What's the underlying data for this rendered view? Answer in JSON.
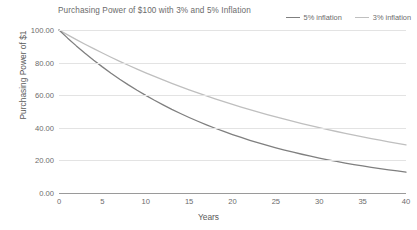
{
  "chart_data": {
    "type": "line",
    "title": "Purchasing Power of $100 with 3% and 5% Inflation",
    "xlabel": "Years",
    "ylabel": "Purchasing Power of $1",
    "xlim": [
      0,
      40
    ],
    "ylim": [
      0,
      100
    ],
    "grid": true,
    "legend_position": "top-right",
    "xticks": [
      "0",
      "5",
      "10",
      "15",
      "20",
      "25",
      "30",
      "35",
      "40"
    ],
    "xtick_values": [
      0,
      5,
      10,
      15,
      20,
      25,
      30,
      35,
      40
    ],
    "yticks": [
      "0.00",
      "20.00",
      "40.00",
      "60.00",
      "80.00",
      "100.00"
    ],
    "ytick_values": [
      0,
      20,
      40,
      60,
      80,
      100
    ],
    "x": [
      0,
      1,
      2,
      3,
      4,
      5,
      6,
      7,
      8,
      9,
      10,
      11,
      12,
      13,
      14,
      15,
      16,
      17,
      18,
      19,
      20,
      21,
      22,
      23,
      24,
      25,
      26,
      27,
      28,
      29,
      30,
      31,
      32,
      33,
      34,
      35,
      36,
      37,
      38,
      39,
      40
    ],
    "series": [
      {
        "name": "5% inflation",
        "color": "#7f7f7f",
        "values": [
          100.0,
          95.0,
          90.25,
          85.74,
          81.45,
          77.38,
          73.51,
          69.83,
          66.34,
          63.02,
          59.87,
          56.88,
          54.04,
          51.33,
          48.77,
          46.33,
          44.01,
          41.81,
          39.72,
          37.74,
          35.85,
          34.06,
          32.35,
          30.74,
          29.2,
          27.74,
          26.35,
          25.03,
          23.77,
          22.59,
          21.46,
          20.38,
          19.36,
          18.39,
          17.47,
          16.6,
          15.77,
          14.98,
          14.23,
          13.52,
          12.85
        ]
      },
      {
        "name": "3% inflation",
        "color": "#bfbfbf",
        "values": [
          100.0,
          97.0,
          94.09,
          91.27,
          88.53,
          85.87,
          83.3,
          80.8,
          78.37,
          76.02,
          73.74,
          71.53,
          69.38,
          67.3,
          65.28,
          63.33,
          61.42,
          59.58,
          57.8,
          56.06,
          54.38,
          52.75,
          51.17,
          49.63,
          48.14,
          46.7,
          45.29,
          43.93,
          42.62,
          41.34,
          40.1,
          38.9,
          37.73,
          36.6,
          35.5,
          34.44,
          33.4,
          32.4,
          31.43,
          30.48,
          29.57
        ]
      }
    ]
  },
  "legend": {
    "items": [
      {
        "label": "5% inflation"
      },
      {
        "label": "3% inflation"
      }
    ]
  }
}
